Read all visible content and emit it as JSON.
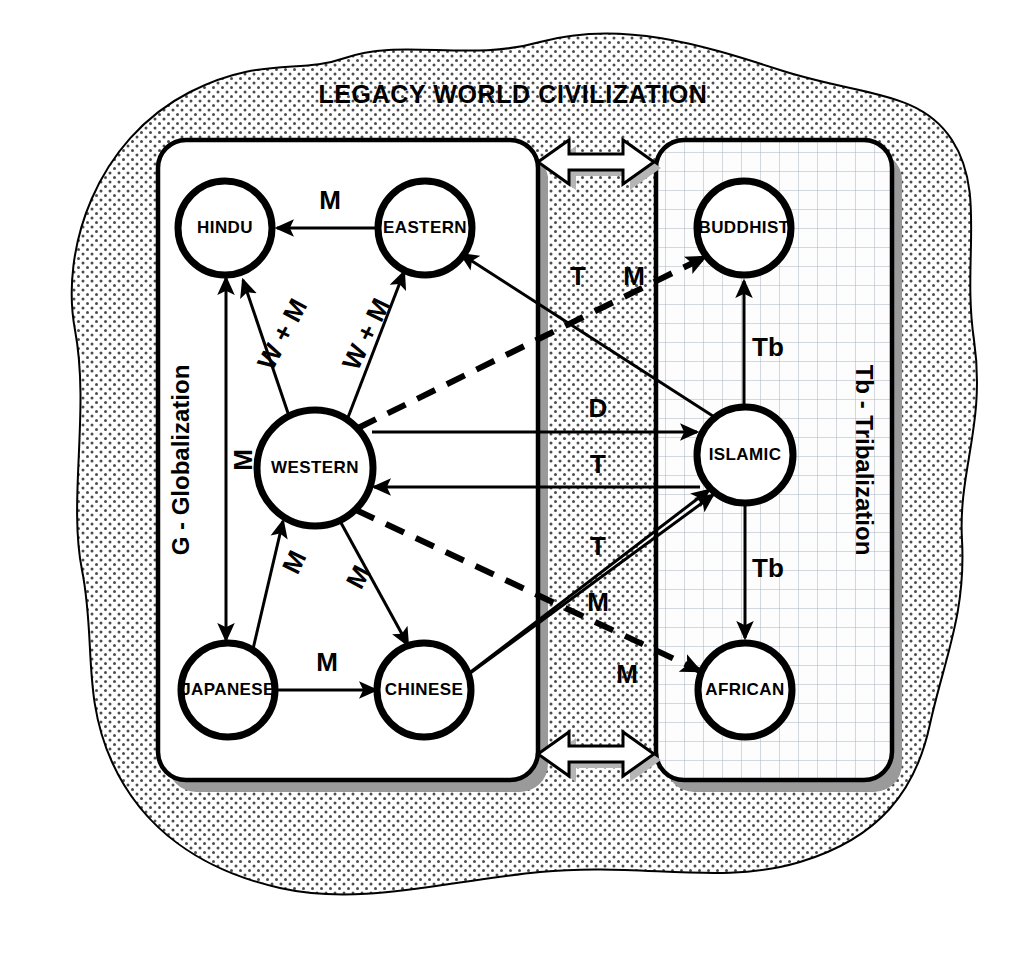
{
  "diagram": {
    "title": "LEGACY WORLD CIVILIZATION",
    "left_panel_label": "G - Globalization",
    "right_panel_label": "Tb - Tribalization",
    "nodes": [
      {
        "id": "hindu",
        "label": "HINDU",
        "cx": 225,
        "cy": 228,
        "r": 47,
        "panel": "left"
      },
      {
        "id": "eastern",
        "label": "EASTERN",
        "cx": 425,
        "cy": 228,
        "r": 47,
        "panel": "left"
      },
      {
        "id": "western",
        "label": "WESTERN",
        "cx": 315,
        "cy": 468,
        "r": 58,
        "panel": "left"
      },
      {
        "id": "japanese",
        "label": "JAPANESE",
        "cx": 228,
        "cy": 690,
        "r": 47,
        "panel": "left"
      },
      {
        "id": "chinese",
        "label": "CHINESE",
        "cx": 424,
        "cy": 690,
        "r": 47,
        "panel": "left"
      },
      {
        "id": "buddhist",
        "label": "BUDDHIST",
        "cx": 744,
        "cy": 228,
        "r": 47,
        "panel": "right"
      },
      {
        "id": "islamic",
        "label": "ISLAMIC",
        "cx": 745,
        "cy": 455,
        "r": 48,
        "panel": "right"
      },
      {
        "id": "african",
        "label": "AFRICAN",
        "cx": 745,
        "cy": 690,
        "r": 47,
        "panel": "right"
      }
    ],
    "edges": [
      {
        "id": "eastern-hindu",
        "from": "eastern",
        "to": "hindu",
        "label": "M",
        "style": "solid",
        "arrows": "one",
        "lx": 330,
        "ly": 202,
        "rot": 0
      },
      {
        "id": "western-hindu",
        "from": "western",
        "to": "hindu",
        "label": "W + M",
        "style": "solid",
        "arrows": "one",
        "lx": 284,
        "ly": 335,
        "rot": -62
      },
      {
        "id": "western-eastern",
        "from": "western",
        "to": "eastern",
        "label": "W + M",
        "style": "solid",
        "arrows": "one",
        "lx": 368,
        "ly": 335,
        "rot": -64
      },
      {
        "id": "hindu-japanese",
        "from": "hindu",
        "to": "japanese",
        "label": "M",
        "style": "solid",
        "arrows": "both",
        "lx": 226,
        "ly": 460,
        "rot": -90
      },
      {
        "id": "japanese-western",
        "from": "japanese",
        "to": "western",
        "label": "M",
        "style": "solid",
        "arrows": "one",
        "lx": 290,
        "ly": 563,
        "rot": -64
      },
      {
        "id": "western-chinese",
        "from": "western",
        "to": "chinese",
        "label": "M",
        "style": "solid",
        "arrows": "one",
        "lx": 360,
        "ly": 575,
        "rot": -62
      },
      {
        "id": "japanese-chinese",
        "from": "japanese",
        "to": "chinese",
        "label": "M",
        "style": "solid",
        "arrows": "one",
        "lx": 327,
        "ly": 664,
        "rot": 0
      },
      {
        "id": "islamic-buddhist",
        "from": "islamic",
        "to": "buddhist",
        "label": "Tb",
        "style": "solid",
        "arrows": "one",
        "lx": 766,
        "ly": 349,
        "rot": 0
      },
      {
        "id": "islamic-african",
        "from": "islamic",
        "to": "african",
        "label": "Tb",
        "style": "solid",
        "arrows": "one",
        "lx": 766,
        "ly": 570,
        "rot": 0
      },
      {
        "id": "western-islamic",
        "from": "western",
        "to": "islamic",
        "label": "D",
        "style": "solid",
        "arrows": "one",
        "lx": 598,
        "ly": 410,
        "rot": 0
      },
      {
        "id": "islamic-western",
        "from": "islamic",
        "to": "western",
        "label": "T",
        "style": "solid",
        "arrows": "one",
        "lx": 598,
        "ly": 478,
        "rot": 0
      },
      {
        "id": "islamic-eastern",
        "from": "islamic",
        "to": "eastern",
        "label": "T",
        "style": "solid",
        "arrows": "one",
        "lx": 577,
        "ly": 278,
        "rot": 0
      },
      {
        "id": "chinese-islamic",
        "from": "chinese",
        "to": "islamic",
        "label": "T",
        "style": "solid",
        "arrows": "one",
        "lx": 598,
        "ly": 556,
        "rot": 0
      },
      {
        "id": "japanese-islamic",
        "from": "japanese",
        "to": "islamic",
        "label": "M",
        "style": "solid",
        "arrows": "one",
        "lx": 598,
        "ly": 604,
        "rot": 0
      },
      {
        "id": "western-buddhist",
        "from": "western",
        "to": "buddhist",
        "label": "M",
        "style": "dashed",
        "arrows": "one",
        "lx": 632,
        "ly": 278,
        "rot": 0
      },
      {
        "id": "western-african",
        "from": "western",
        "to": "african",
        "label": "M",
        "style": "dashed",
        "arrows": "one",
        "lx": 627,
        "ly": 676,
        "rot": 0
      }
    ],
    "connectors": [
      {
        "id": "top-connector",
        "label": "double-headed-arrow"
      },
      {
        "id": "bottom-connector",
        "label": "double-headed-arrow"
      }
    ],
    "colors": {
      "outline": "#000000",
      "paper": "#ffffff",
      "shadow": "#9a9a9a",
      "stipple": "#555555",
      "grid": "#9aa6b2"
    }
  }
}
